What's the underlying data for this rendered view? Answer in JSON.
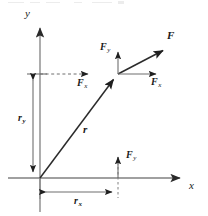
{
  "figure": {
    "background_color": "#ffffff",
    "axis_color": "#808080",
    "line_color": "#7d7d7d",
    "vector_color": "#2b2b2b",
    "label_color": "#1a1a1a",
    "width": 208,
    "height": 216
  },
  "axes": {
    "origin": {
      "x": 40,
      "y": 178
    },
    "x_axis": {
      "label": "x",
      "label_pos": {
        "x": 190,
        "y": 182
      },
      "from": {
        "x": 8,
        "y": 178
      },
      "to": {
        "x": 186,
        "y": 178
      }
    },
    "y_axis": {
      "label": "y",
      "label_pos": {
        "x": 26,
        "y": 10
      },
      "from": {
        "x": 40,
        "y": 212
      },
      "to": {
        "x": 40,
        "y": 22
      }
    }
  },
  "vectors": [
    {
      "name": "r",
      "label": "r",
      "label_pos": {
        "x": 83,
        "y": 124
      },
      "from": {
        "x": 40,
        "y": 178
      },
      "to": {
        "x": 118,
        "y": 74
      },
      "style": "solid-bold"
    },
    {
      "name": "F",
      "label": "F",
      "label_pos": {
        "x": 167,
        "y": 31
      },
      "from": {
        "x": 118,
        "y": 74
      },
      "to": {
        "x": 168,
        "y": 48
      },
      "style": "solid-bold"
    },
    {
      "name": "F_x_right",
      "label": "F",
      "subscript": "x",
      "label_pos": {
        "x": 152,
        "y": 78
      },
      "from": {
        "x": 118,
        "y": 74
      },
      "to": {
        "x": 162,
        "y": 74
      },
      "style": "solid-thin"
    },
    {
      "name": "F_y_top",
      "label": "F",
      "subscript": "y",
      "label_pos": {
        "x": 101,
        "y": 44
      },
      "from": {
        "x": 118,
        "y": 74
      },
      "to": {
        "x": 118,
        "y": 46
      },
      "style": "solid-thin"
    },
    {
      "name": "F_x_dashed",
      "label": "F",
      "subscript": "x",
      "label_pos": {
        "x": 78,
        "y": 80
      },
      "from": {
        "x": 40,
        "y": 74
      },
      "to": {
        "x": 94,
        "y": 74
      },
      "style": "dashed"
    },
    {
      "name": "F_y_bottom",
      "label": "F",
      "subscript": "y",
      "label_pos": {
        "x": 127,
        "y": 152
      },
      "from": {
        "x": 118,
        "y": 178
      },
      "to": {
        "x": 118,
        "y": 151
      },
      "style": "solid-thin"
    }
  ],
  "dimensions": [
    {
      "name": "r_y",
      "label": "r",
      "subscript": "y",
      "label_pos": {
        "x": 21,
        "y": 118
      },
      "orientation": "vertical",
      "from": {
        "x": 33,
        "y": 74
      },
      "to": {
        "x": 33,
        "y": 178
      }
    },
    {
      "name": "r_x",
      "label": "r",
      "subscript": "x",
      "label_pos": {
        "x": 76,
        "y": 199
      },
      "orientation": "horizontal",
      "from": {
        "x": 40,
        "y": 192
      },
      "to": {
        "x": 118,
        "y": 192
      }
    }
  ],
  "guides": [
    {
      "name": "tick-ry-top",
      "from": {
        "x": 27,
        "y": 74
      },
      "to": {
        "x": 47,
        "y": 74
      },
      "style": "solid"
    },
    {
      "name": "dashed-vertical-rx",
      "from": {
        "x": 118,
        "y": 158
      },
      "to": {
        "x": 118,
        "y": 198
      },
      "style": "dashed"
    },
    {
      "name": "extension-origin",
      "from": {
        "x": 40,
        "y": 178
      },
      "to": {
        "x": 40,
        "y": 198
      },
      "style": "solid"
    }
  ]
}
